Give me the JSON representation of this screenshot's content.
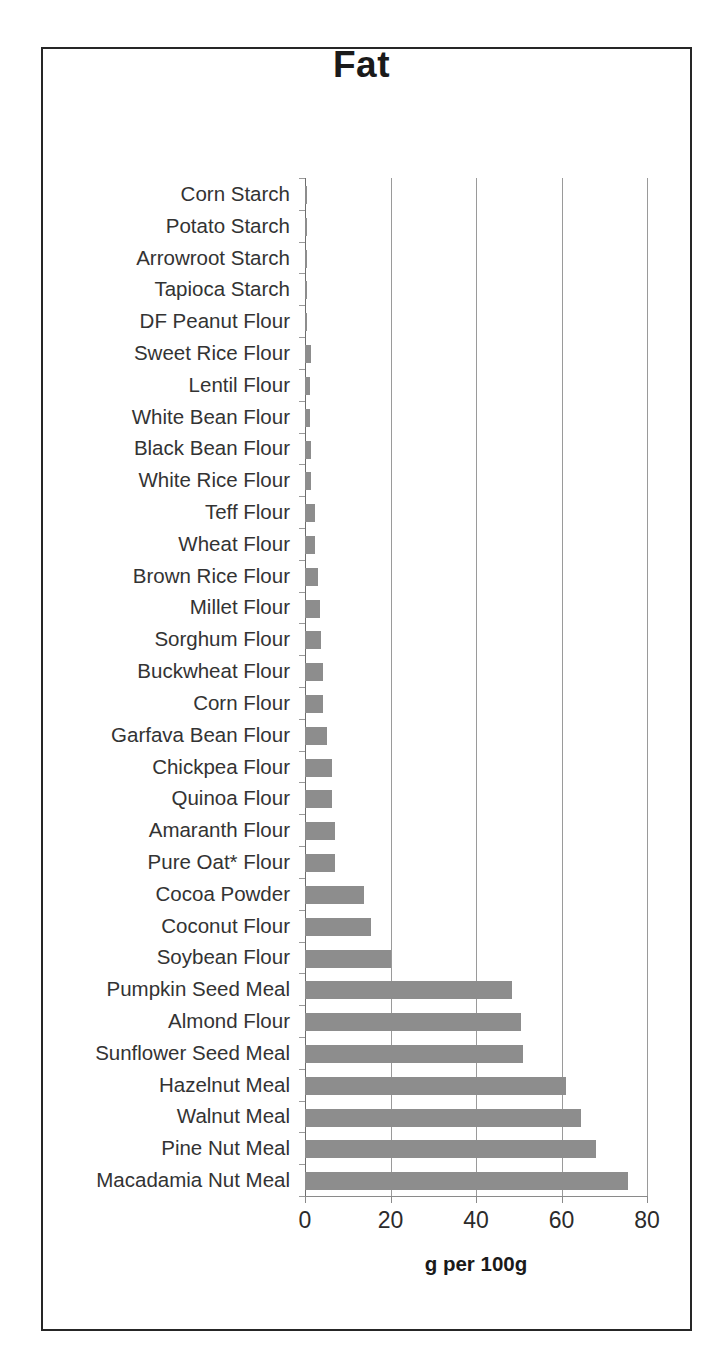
{
  "figure": {
    "title": "Fat",
    "xaxis_title": "g per 100g",
    "bar_color": "#8d8d8d",
    "frame_color": "#262626",
    "gridline_color": "#9a9a9a"
  },
  "chart_data": {
    "type": "bar",
    "orientation": "horizontal",
    "title": "Fat",
    "xlabel": "g per 100g",
    "ylabel": "",
    "xlim": [
      0,
      80
    ],
    "xticks": [
      0,
      20,
      40,
      60,
      80
    ],
    "grid": true,
    "legend": null,
    "units": "g per 100g",
    "categories": [
      "Corn Starch",
      "Potato Starch",
      "Arrowroot Starch",
      "Tapioca Starch",
      "DF Peanut Flour",
      "Sweet Rice Flour",
      "Lentil Flour",
      "White Bean Flour",
      "Black Bean Flour",
      "White Rice Flour",
      "Teff Flour",
      "Wheat Flour",
      "Brown Rice Flour",
      "Millet Flour",
      "Sorghum Flour",
      "Buckwheat Flour",
      "Corn Flour",
      "Garfava Bean Flour",
      "Chickpea Flour",
      "Quinoa Flour",
      "Amaranth Flour",
      "Pure Oat* Flour",
      "Cocoa Powder",
      "Coconut Flour",
      "Soybean Flour",
      "Pumpkin Seed Meal",
      "Almond Flour",
      "Sunflower Seed Meal",
      "Hazelnut Meal",
      "Walnut Meal",
      "Pine Nut Meal",
      "Macadamia Nut Meal"
    ],
    "values": [
      0.3,
      0.4,
      0.4,
      0.2,
      0.3,
      1.4,
      1.1,
      1.2,
      1.4,
      1.4,
      2.4,
      2.4,
      3.0,
      3.5,
      3.8,
      4.1,
      4.1,
      5.1,
      6.3,
      6.3,
      7.0,
      7.0,
      13.7,
      15.5,
      20.0,
      48.5,
      50.5,
      51.0,
      61.0,
      64.5,
      68.0,
      75.5
    ]
  },
  "xticklabels": [
    "0",
    "20",
    "40",
    "60",
    "80"
  ]
}
